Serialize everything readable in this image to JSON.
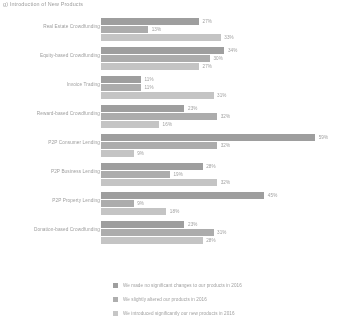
{
  "chart_data": {
    "type": "bar",
    "orientation": "horizontal",
    "title": "g) Introduction of New Products",
    "xlabel": "",
    "ylabel": "",
    "xlim": [
      0,
      60
    ],
    "grid": false,
    "legend_position": "bottom",
    "value_suffix": "%",
    "categories": [
      "Real Estate Crowdfunding",
      "Equity-based Crowdfunding",
      "Invoice Trading",
      "Reward-based Crowdfunding",
      "P2P Consumer Lending",
      "P2P Business Lending",
      "P2P Property Lending",
      "Donation-based Crowdfunding"
    ],
    "series": [
      {
        "name": "We made no significant changes to our products in 2016",
        "color": "#9d9d9d",
        "values": [
          27,
          34,
          11,
          23,
          59,
          28,
          45,
          23
        ],
        "labels": [
          "27%",
          "34%",
          "11%",
          "23%",
          "59%",
          "28%",
          "45%",
          "23%"
        ]
      },
      {
        "name": "We slightly altered our products in 2016",
        "color": "#b2b2b2",
        "values": [
          13,
          30,
          11,
          32,
          32,
          19,
          9,
          31
        ],
        "labels": [
          "13%",
          "30%",
          "11%",
          "32%",
          "32%",
          "19%",
          "9%",
          "31%"
        ]
      },
      {
        "name": "We introduced significantly our new products in 2016",
        "color": "#d2d2d2",
        "values": [
          33,
          27,
          31,
          16,
          9,
          32,
          18,
          28
        ],
        "labels": [
          "33%",
          "27%",
          "31%",
          "16%",
          "9%",
          "32%",
          "18%",
          "28%"
        ]
      }
    ]
  }
}
